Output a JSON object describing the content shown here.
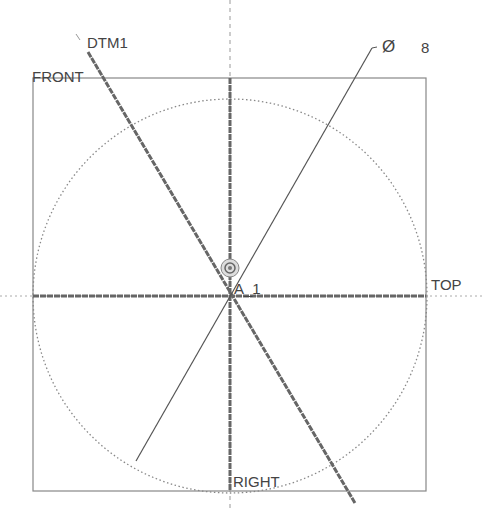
{
  "sketch": {
    "labels": {
      "dtm1": "DTM1",
      "front": "FRONT",
      "top": "TOP",
      "right": "RIGHT",
      "axis": "A_1"
    },
    "dimension": {
      "symbol": "Ø",
      "value": "8"
    },
    "colors": {
      "line": "#555555",
      "datum": "#777777",
      "border": "#888888",
      "background": "#ffffff"
    }
  }
}
